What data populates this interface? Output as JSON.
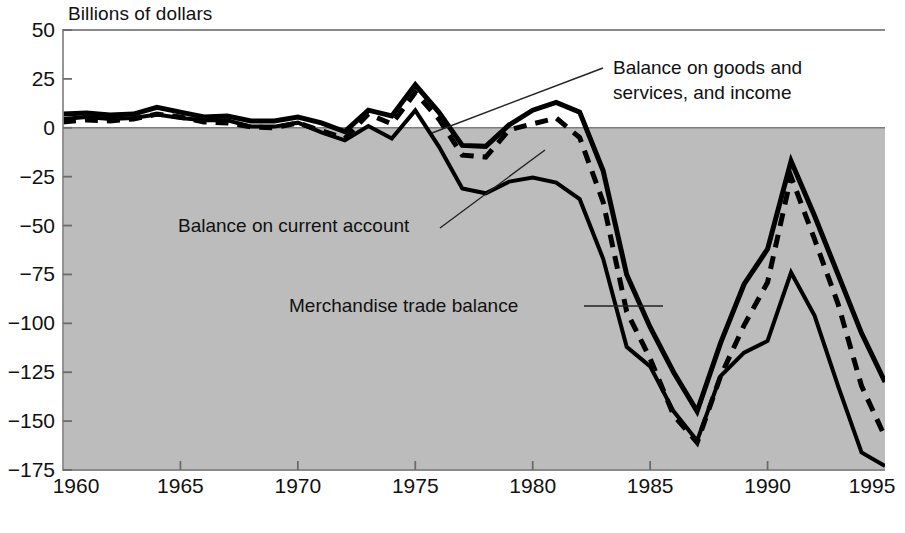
{
  "chart_data": {
    "type": "line",
    "title": "",
    "ylabel": "Billions of dollars",
    "xlabel": "",
    "xlim": [
      1960,
      1995
    ],
    "ylim": [
      -175,
      50
    ],
    "grid": false,
    "legend_position": "inline-annotations",
    "yticks": [
      50,
      25,
      0,
      -25,
      -50,
      -75,
      -100,
      -125,
      -150,
      -175
    ],
    "ytick_labels": [
      "50",
      "25",
      "0",
      "−25",
      "−50",
      "−75",
      "−100",
      "−125",
      "−150",
      "−175"
    ],
    "xticks": [
      1960,
      1965,
      1970,
      1975,
      1980,
      1985,
      1990,
      1995
    ],
    "xtick_labels": [
      "1960",
      "1965",
      "1970",
      "1975",
      "1980",
      "1985",
      "1990",
      "1995"
    ],
    "x": [
      1960,
      1961,
      1962,
      1963,
      1964,
      1965,
      1966,
      1967,
      1968,
      1969,
      1970,
      1971,
      1972,
      1973,
      1974,
      1975,
      1976,
      1977,
      1978,
      1979,
      1980,
      1981,
      1982,
      1983,
      1984,
      1985,
      1986,
      1987,
      1988,
      1989,
      1990,
      1991,
      1992,
      1993,
      1994,
      1995
    ],
    "series": [
      {
        "name": "Balance on goods and services, and income",
        "style": "solid",
        "color": "#000000",
        "linewidth": 5,
        "values": [
          7.0,
          7.5,
          6.5,
          7.0,
          10.5,
          8.0,
          5.5,
          6.0,
          3.5,
          3.5,
          5.5,
          2.5,
          -2.0,
          9.0,
          6.0,
          22.0,
          8.0,
          -9.0,
          -9.5,
          1.5,
          9.0,
          13.0,
          8.0,
          -22.0,
          -75.0,
          -102.0,
          -125.0,
          -145.0,
          -110.0,
          -80.0,
          -62.0,
          -17.0,
          -45.0,
          -75.0,
          -105.0,
          -130.0
        ]
      },
      {
        "name": "Balance on current account",
        "style": "dashed",
        "color": "#000000",
        "linewidth": 5,
        "values": [
          3.0,
          4.0,
          3.5,
          4.5,
          7.0,
          5.5,
          3.0,
          2.5,
          0.5,
          0.0,
          2.5,
          -1.5,
          -5.5,
          7.0,
          2.0,
          18.0,
          4.5,
          -14.0,
          -15.0,
          -1.0,
          2.0,
          5.0,
          -5.0,
          -38.0,
          -94.0,
          -118.0,
          -147.0,
          -161.0,
          -127.0,
          -101.0,
          -79.0,
          -25.0,
          -57.0,
          -90.0,
          -132.0,
          -158.0
        ]
      },
      {
        "name": "Merchandise trade balance",
        "style": "solid",
        "color": "#000000",
        "linewidth": 4,
        "values": [
          4.5,
          5.5,
          4.5,
          5.0,
          6.8,
          5.0,
          3.8,
          3.8,
          0.6,
          0.6,
          2.6,
          -2.3,
          -6.4,
          0.9,
          -5.5,
          8.9,
          -9.5,
          -31.0,
          -33.5,
          -27.5,
          -25.5,
          -28.0,
          -36.5,
          -67.0,
          -112.0,
          -122.0,
          -145.0,
          -160.0,
          -127.0,
          -115.0,
          -109.0,
          -74.0,
          -96.0,
          -132.0,
          -166.0,
          -173.0
        ]
      }
    ],
    "annotations": [
      {
        "id": "annot-goods-services",
        "lines": [
          "Balance on goods and",
          "services, and income"
        ],
        "text_x": 613,
        "text_y": 74,
        "leader": {
          "x1": 603,
          "y1": 68,
          "x2": 432,
          "y2": 133
        }
      },
      {
        "id": "annot-current-account",
        "lines": [
          "Balance on current account"
        ],
        "text_x": 178,
        "text_y": 232,
        "leader": {
          "x1": 440,
          "y1": 228,
          "x2": 545,
          "y2": 150
        }
      },
      {
        "id": "annot-merchandise",
        "lines": [
          "Merchandise trade balance"
        ],
        "text_x": 289,
        "text_y": 312,
        "leader": {
          "x1": 584,
          "y1": 306,
          "x2": 663,
          "y2": 306
        }
      }
    ],
    "colors": {
      "negative_fill": "#bcbcbc",
      "positive_fill": "#ffffff",
      "axis": "#6b6b6b",
      "line": "#000000"
    }
  }
}
